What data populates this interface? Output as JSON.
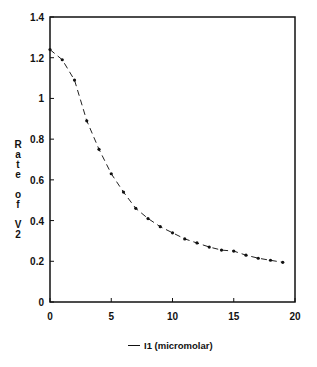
{
  "chart_data": {
    "type": "line",
    "title": "",
    "xlabel": "",
    "ylabel": "Rate of V2",
    "xlim": [
      0,
      20
    ],
    "ylim": [
      0,
      1.4
    ],
    "xticks": [
      0,
      5,
      10,
      15,
      20
    ],
    "yticks": [
      0,
      0.2,
      0.4,
      0.6,
      0.8,
      1,
      1.2,
      1.4
    ],
    "ytick_labels": [
      "0",
      "0.2",
      "0.4",
      "0.6",
      "0.8",
      "1",
      "1.2",
      "1.4"
    ],
    "grid": false,
    "legend_position": "bottom-center",
    "series": [
      {
        "name": "I1 (micromolar)",
        "x": [
          0,
          1,
          2,
          3,
          4,
          5,
          6,
          7,
          8,
          9,
          10,
          11,
          12,
          13,
          14,
          15,
          16,
          17,
          18,
          19
        ],
        "values": [
          1.24,
          1.19,
          1.09,
          0.89,
          0.75,
          0.63,
          0.54,
          0.46,
          0.41,
          0.37,
          0.34,
          0.31,
          0.29,
          0.27,
          0.255,
          0.25,
          0.23,
          0.215,
          0.205,
          0.195
        ]
      }
    ]
  },
  "ylabel_letters": [
    "R",
    "a",
    "t",
    "e",
    "",
    "o",
    "f",
    "",
    "V",
    "2"
  ],
  "legend": {
    "label": "I1 (micromolar)"
  }
}
